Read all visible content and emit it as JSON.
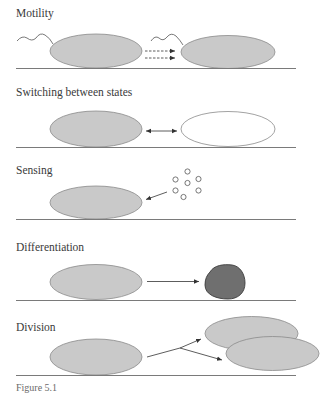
{
  "figure": {
    "panels": [
      {
        "id": "motility",
        "label": "Motility"
      },
      {
        "id": "switching",
        "label": "Switching between states"
      },
      {
        "id": "sensing",
        "label": "Sensing"
      },
      {
        "id": "differentiation",
        "label": "Differentiation"
      },
      {
        "id": "division",
        "label": "Division"
      }
    ],
    "caption": "Figure 5.1"
  },
  "colors": {
    "cell_fill": "#c9c9c9",
    "cell_stroke": "#8a8a8a",
    "differentiated_fill": "#6f6f6f",
    "differentiated_stroke": "#3c3c3c",
    "open_cell_fill": "#ffffff",
    "baseline": "#7a7a7a",
    "arrow": "#333333",
    "label": "#3a3a3a"
  }
}
